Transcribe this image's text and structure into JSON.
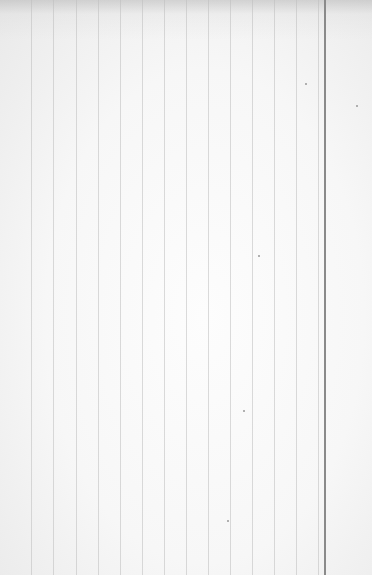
{
  "scene": {
    "description": "Photo of blank ruled paper with vertical lines",
    "paper_color": "#f6f6f6",
    "rule_color": "#bebebe",
    "margin_line_color": "#8a8a8a",
    "rule_positions_x": [
      31,
      53,
      76,
      98,
      120,
      142,
      164,
      186,
      208,
      230,
      252,
      274,
      296,
      318
    ],
    "margin_line_x": 324,
    "specks": [
      [
        305,
        83
      ],
      [
        356,
        105
      ],
      [
        258,
        255
      ],
      [
        243,
        410
      ],
      [
        227,
        520
      ]
    ]
  }
}
